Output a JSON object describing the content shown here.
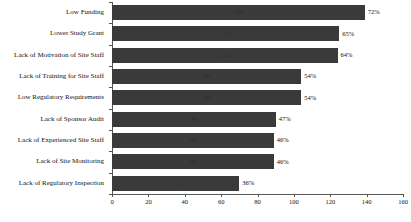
{
  "chart_data": {
    "type": "bar",
    "orientation": "horizontal",
    "title": "",
    "xlabel": "",
    "ylabel": "",
    "xlim": [
      0,
      160
    ],
    "xticks": [
      0,
      20,
      40,
      60,
      80,
      100,
      120,
      140,
      160
    ],
    "grid": false,
    "legend": "none",
    "bar_color": "#3a3a3a",
    "categories": [
      "Low Funding",
      "Lower Study Grant",
      "Lack of Motivation of Site Staff",
      "Lack of Training for Site Staff",
      "Low Regulatory Requirements",
      "Lack of Sponsor Audit",
      "Lack of Experienced Site Staff",
      "Lack of Site Monitoring",
      "Lack of Regulatory Inspection"
    ],
    "values": [
      139,
      125,
      124,
      104,
      104,
      90,
      89,
      89,
      70
    ],
    "bars": [
      {
        "category": "Low Funding",
        "value": 139,
        "count_label": "139",
        "percent_label": "72%"
      },
      {
        "category": "Lower Study Grant",
        "value": 125,
        "count_label": "125",
        "percent_label": "65%"
      },
      {
        "category": "Lack of Motivation of Site Staff",
        "value": 124,
        "count_label": "124",
        "percent_label": "64%"
      },
      {
        "category": "Lack of Training for Site Staff",
        "value": 104,
        "count_label": "104",
        "percent_label": "54%"
      },
      {
        "category": "Low Regulatory Requirements",
        "value": 104,
        "count_label": "104",
        "percent_label": "54%"
      },
      {
        "category": "Lack of Sponsor Audit",
        "value": 90,
        "count_label": "90",
        "percent_label": "47%"
      },
      {
        "category": "Lack of Experienced Site Staff",
        "value": 89,
        "count_label": "89",
        "percent_label": "46%"
      },
      {
        "category": "Lack of Site Monitoring",
        "value": 89,
        "count_label": "89",
        "percent_label": "46%"
      },
      {
        "category": "Lack of Regulatory Inspection",
        "value": 70,
        "count_label": "70",
        "percent_label": "36%"
      }
    ]
  }
}
